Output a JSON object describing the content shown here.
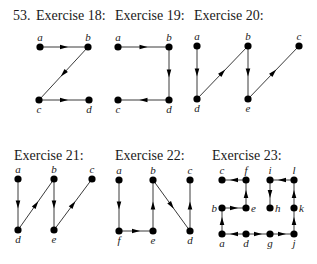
{
  "problem_number": "53.",
  "colors": {
    "node": "#000000",
    "edge": "#3a3a3a",
    "text": "#1a1a1a"
  },
  "exercises": [
    {
      "title": "Exercise 18:",
      "title_pos": [
        36,
        20
      ],
      "nodes": [
        {
          "id": "a",
          "x": 40,
          "y": 47,
          "label_pos": "above"
        },
        {
          "id": "b",
          "x": 88,
          "y": 47,
          "label_pos": "above"
        },
        {
          "id": "c",
          "x": 39,
          "y": 100,
          "label_pos": "below"
        },
        {
          "id": "d",
          "x": 89,
          "y": 100,
          "label_pos": "below"
        }
      ],
      "edges": [
        [
          "a",
          "b"
        ],
        [
          "b",
          "c"
        ],
        [
          "c",
          "d"
        ]
      ]
    },
    {
      "title": "Exercise 19:",
      "title_pos": [
        115,
        20
      ],
      "nodes": [
        {
          "id": "a",
          "x": 118,
          "y": 47,
          "label_pos": "above"
        },
        {
          "id": "b",
          "x": 169,
          "y": 47,
          "label_pos": "above"
        },
        {
          "id": "c",
          "x": 118,
          "y": 100,
          "label_pos": "below"
        },
        {
          "id": "d",
          "x": 169,
          "y": 100,
          "label_pos": "below"
        }
      ],
      "edges": [
        [
          "a",
          "b"
        ],
        [
          "b",
          "d"
        ],
        [
          "d",
          "c"
        ]
      ]
    },
    {
      "title": "Exercise 20:",
      "title_pos": [
        194,
        20
      ],
      "nodes": [
        {
          "id": "a",
          "x": 197,
          "y": 46,
          "label_pos": "above"
        },
        {
          "id": "b",
          "x": 248,
          "y": 46,
          "label_pos": "above"
        },
        {
          "id": "c",
          "x": 299,
          "y": 46,
          "label_pos": "above"
        },
        {
          "id": "d",
          "x": 197,
          "y": 99,
          "label_pos": "below"
        },
        {
          "id": "e",
          "x": 248,
          "y": 99,
          "label_pos": "below"
        }
      ],
      "edges": [
        [
          "a",
          "d"
        ],
        [
          "d",
          "b"
        ],
        [
          "b",
          "e"
        ],
        [
          "e",
          "c"
        ]
      ]
    },
    {
      "title": "Exercise 21:",
      "title_pos": [
        14,
        160
      ],
      "nodes": [
        {
          "id": "a",
          "x": 18,
          "y": 179,
          "label_pos": "above"
        },
        {
          "id": "b",
          "x": 54,
          "y": 179,
          "label_pos": "above"
        },
        {
          "id": "c",
          "x": 92,
          "y": 179,
          "label_pos": "above"
        },
        {
          "id": "d",
          "x": 18,
          "y": 230,
          "label_pos": "below"
        },
        {
          "id": "e",
          "x": 54,
          "y": 230,
          "label_pos": "below"
        }
      ],
      "edges": [
        [
          "a",
          "d"
        ],
        [
          "d",
          "b"
        ],
        [
          "b",
          "e"
        ],
        [
          "e",
          "c"
        ]
      ]
    },
    {
      "title": "Exercise 22:",
      "title_pos": [
        115,
        160
      ],
      "nodes": [
        {
          "id": "a",
          "x": 119,
          "y": 180,
          "label_pos": "above"
        },
        {
          "id": "b",
          "x": 153,
          "y": 180,
          "label_pos": "above"
        },
        {
          "id": "c",
          "x": 190,
          "y": 180,
          "label_pos": "above"
        },
        {
          "id": "f",
          "x": 119,
          "y": 231,
          "label_pos": "below"
        },
        {
          "id": "e",
          "x": 153,
          "y": 231,
          "label_pos": "below"
        },
        {
          "id": "d",
          "x": 190,
          "y": 231,
          "label_pos": "below"
        }
      ],
      "edges": [
        [
          "a",
          "f"
        ],
        [
          "f",
          "e"
        ],
        [
          "e",
          "b"
        ],
        [
          "b",
          "d"
        ],
        [
          "d",
          "c"
        ]
      ]
    },
    {
      "title": "Exercise 23:",
      "title_pos": [
        212,
        160
      ],
      "nodes": [
        {
          "id": "c",
          "x": 222,
          "y": 180,
          "label_pos": "above"
        },
        {
          "id": "f",
          "x": 246,
          "y": 180,
          "label_pos": "above"
        },
        {
          "id": "i",
          "x": 270,
          "y": 180,
          "label_pos": "above"
        },
        {
          "id": "l",
          "x": 294,
          "y": 180,
          "label_pos": "above"
        },
        {
          "id": "b",
          "x": 222,
          "y": 208,
          "label_pos": "left"
        },
        {
          "id": "e",
          "x": 246,
          "y": 208,
          "label_pos": "right"
        },
        {
          "id": "h",
          "x": 270,
          "y": 208,
          "label_pos": "right"
        },
        {
          "id": "k",
          "x": 294,
          "y": 208,
          "label_pos": "right"
        },
        {
          "id": "a",
          "x": 222,
          "y": 234,
          "label_pos": "below"
        },
        {
          "id": "d",
          "x": 246,
          "y": 234,
          "label_pos": "below"
        },
        {
          "id": "g",
          "x": 270,
          "y": 234,
          "label_pos": "below"
        },
        {
          "id": "j",
          "x": 294,
          "y": 234,
          "label_pos": "below"
        }
      ],
      "edges": [
        [
          "f",
          "c"
        ],
        [
          "e",
          "f"
        ],
        [
          "b",
          "e"
        ],
        [
          "a",
          "b"
        ],
        [
          "d",
          "a"
        ],
        [
          "d",
          "g"
        ],
        [
          "g",
          "j"
        ],
        [
          "j",
          "k"
        ],
        [
          "k",
          "l"
        ],
        [
          "l",
          "i"
        ],
        [
          "i",
          "h"
        ]
      ]
    }
  ]
}
